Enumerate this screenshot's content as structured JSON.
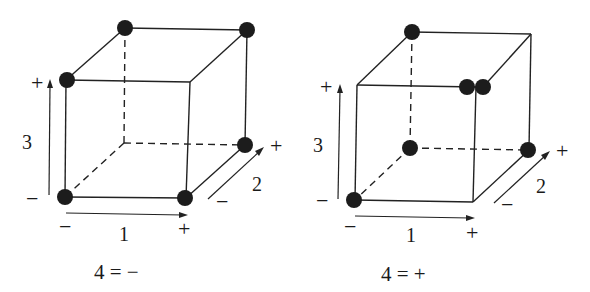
{
  "figure": {
    "type": "fractional-factorial-design-cube-plots",
    "panels": [
      {
        "caption": "4 = −",
        "axis_labels": {
          "x": "1",
          "y": "3",
          "z": "2"
        },
        "signs": {
          "x_low": "−",
          "x_high": "+",
          "y_low": "−",
          "y_high": "+",
          "z_low": "−",
          "z_high": "+"
        },
        "runs_marked": [
          {
            "factor1": "−",
            "factor2": "−",
            "factor3": "−"
          },
          {
            "factor1": "+",
            "factor2": "−",
            "factor3": "−"
          },
          {
            "factor1": "+",
            "factor2": "+",
            "factor3": "−"
          },
          {
            "factor1": "−",
            "factor2": "−",
            "factor3": "+"
          },
          {
            "factor1": "−",
            "factor2": "+",
            "factor3": "+"
          },
          {
            "factor1": "+",
            "factor2": "+",
            "factor3": "+"
          }
        ]
      },
      {
        "caption": "4 = +",
        "axis_labels": {
          "x": "1",
          "y": "3",
          "z": "2"
        },
        "signs": {
          "x_low": "−",
          "x_high": "+",
          "y_low": "−",
          "y_high": "+",
          "z_low": "−",
          "z_high": "+"
        },
        "runs_marked": [
          {
            "factor1": "−",
            "factor2": "−",
            "factor3": "−"
          },
          {
            "factor1": "−",
            "factor2": "+",
            "factor3": "−"
          },
          {
            "factor1": "+",
            "factor2": "+",
            "factor3": "−"
          },
          {
            "factor1": "−",
            "factor2": "+",
            "factor3": "+"
          },
          {
            "factor1": "+",
            "factor2": "−",
            "factor3": "+",
            "count": 2
          }
        ]
      }
    ]
  }
}
